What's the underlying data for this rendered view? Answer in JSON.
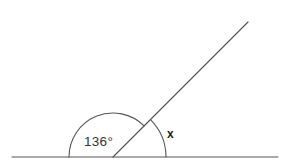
{
  "diagram": {
    "kind": "angle-diagram",
    "background_color": "#ffffff",
    "stroke_color": "#555555",
    "text_color": "#333333",
    "canvas": {
      "width": 288,
      "height": 168
    },
    "vertex": {
      "x": 113,
      "y": 157
    },
    "baseline": {
      "name": "straight-line",
      "x1": 12,
      "y1": 157,
      "x2": 278,
      "y2": 157
    },
    "ray": {
      "name": "slanted-ray",
      "x1": 113,
      "y1": 157,
      "x2": 248,
      "y2": 22,
      "elevation_degrees": 45
    },
    "angles": [
      {
        "id": "angle-known",
        "label": "136°",
        "value": 136,
        "unit": "degrees",
        "arc_radius": 44,
        "label_x": 84,
        "label_y": 146
      },
      {
        "id": "angle-unknown",
        "label": "x",
        "value": null,
        "unit": "degrees",
        "arc_radius": 53,
        "label_x": 167,
        "label_y": 138
      }
    ]
  }
}
